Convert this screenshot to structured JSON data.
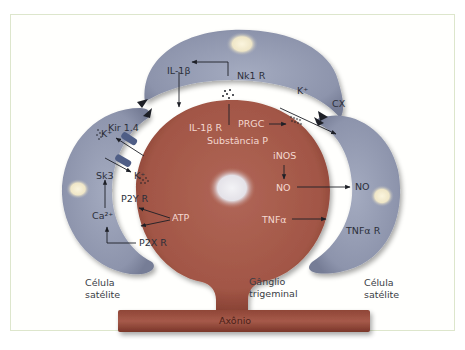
{
  "diagram": {
    "colors": {
      "neuron": "#a65a4d",
      "neuron_dark": "#7f3a30",
      "satellite": "#8e95ad",
      "satellite_light": "#aab0c4",
      "nucleus_neuron": "#e8e6ea",
      "nucleus_satellite": "#f1ead0",
      "frame_border": "#dde6cc",
      "text_dark": "#2c2f3a",
      "text_light": "#f4d8d0"
    },
    "neuron": {
      "labels": {
        "il1b_r": "IL-1β R",
        "substancia_p": "Substância P",
        "prgc": "PRGC",
        "inos": "iNOS",
        "no": "NO",
        "atp": "ATP",
        "tnfa": "TNFα"
      },
      "caption": [
        "Gânglio",
        "trigeminal"
      ],
      "axon_label": "Axônio"
    },
    "satellite_top": {
      "labels": {
        "il1b": "IL-1β",
        "nk1r": "Nk1 R",
        "k": "K⁺",
        "cx": "CX"
      }
    },
    "satellite_left": {
      "labels": {
        "kir": "Kir 1.4",
        "k_in": "K⁺",
        "sk3": "Sk3",
        "k_out": "K⁺",
        "ca": "Ca²⁺",
        "p2yr": "P2Y R",
        "p2xr": "P2X R"
      },
      "caption": [
        "Célula",
        "satélite"
      ]
    },
    "satellite_right": {
      "labels": {
        "no": "NO",
        "tnfar": "TNFα R"
      },
      "caption": [
        "Célula",
        "satélite"
      ]
    }
  }
}
